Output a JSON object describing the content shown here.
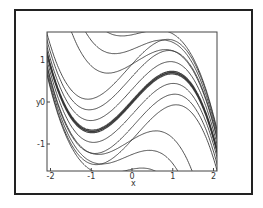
{
  "chart_data": {
    "type": "line",
    "title": "",
    "xlabel": "x",
    "ylabel": "y",
    "xlim": [
      -2,
      2
    ],
    "ylim": [
      -1.65,
      1.65
    ],
    "xticks": [
      "-2",
      "-1",
      "0",
      "1",
      "2"
    ],
    "yticks": [
      "1",
      "0",
      "-1"
    ],
    "grid": false,
    "legend": null,
    "separatrix": {
      "a": 1.075,
      "b": 0.375,
      "points": [
        [
          -2,
          0.85
        ],
        [
          -1,
          -0.7
        ],
        [
          0,
          0
        ],
        [
          1,
          0.7
        ],
        [
          2,
          -0.85
        ]
      ]
    },
    "series": [
      {
        "name": "curve",
        "offset": -0.9
      },
      {
        "name": "curve",
        "offset": -0.6
      },
      {
        "name": "curve",
        "offset": -0.3
      },
      {
        "name": "curve",
        "offset": 0.0
      },
      {
        "name": "curve",
        "offset": 0.3
      },
      {
        "name": "curve",
        "offset": 0.6
      },
      {
        "name": "curve",
        "offset": 0.9
      }
    ]
  },
  "axes": {
    "x_label": "x",
    "y_label": "y"
  }
}
